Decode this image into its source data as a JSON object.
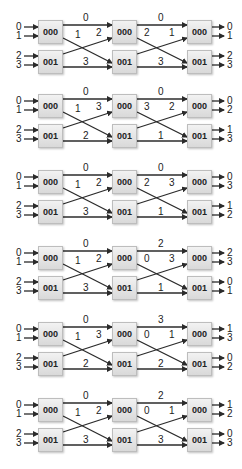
{
  "diagrams": [
    {
      "inputs": [
        "0",
        "1",
        "2",
        "3"
      ],
      "boxes": [
        "000",
        "001",
        "000",
        "001",
        "000",
        "001"
      ],
      "stage1": {
        "top": "0",
        "cross_down": "1",
        "cross_up": "2",
        "bottom": "3"
      },
      "stage2": {
        "top": "0",
        "cross_down": "2",
        "cross_up": "1",
        "bottom": "3"
      },
      "outputs": [
        "0",
        "1",
        "2",
        "3"
      ]
    },
    {
      "inputs": [
        "0",
        "1",
        "2",
        "3"
      ],
      "boxes": [
        "000",
        "001",
        "000",
        "001",
        "000",
        "001"
      ],
      "stage1": {
        "top": "0",
        "cross_down": "1",
        "cross_up": "3",
        "bottom": "2"
      },
      "stage2": {
        "top": "0",
        "cross_down": "3",
        "cross_up": "2",
        "bottom": "1"
      },
      "outputs": [
        "0",
        "2",
        "1",
        "3"
      ]
    },
    {
      "inputs": [
        "0",
        "1",
        "2",
        "3"
      ],
      "boxes": [
        "000",
        "001",
        "000",
        "001",
        "000",
        "001"
      ],
      "stage1": {
        "top": "0",
        "cross_down": "1",
        "cross_up": "2",
        "bottom": "3"
      },
      "stage2": {
        "top": "0",
        "cross_down": "2",
        "cross_up": "3",
        "bottom": "1"
      },
      "outputs": [
        "0",
        "3",
        "1",
        "2"
      ]
    },
    {
      "inputs": [
        "0",
        "1",
        "2",
        "3"
      ],
      "boxes": [
        "000",
        "001",
        "000",
        "001",
        "000",
        "001"
      ],
      "stage1": {
        "top": "0",
        "cross_down": "1",
        "cross_up": "2",
        "bottom": "3"
      },
      "stage2": {
        "top": "2",
        "cross_down": "0",
        "cross_up": "3",
        "bottom": "1"
      },
      "outputs": [
        "2",
        "3",
        "0",
        "1"
      ]
    },
    {
      "inputs": [
        "0",
        "1",
        "2",
        "3"
      ],
      "boxes": [
        "000",
        "001",
        "000",
        "001",
        "000",
        "001"
      ],
      "stage1": {
        "top": "0",
        "cross_down": "1",
        "cross_up": "3",
        "bottom": "2"
      },
      "stage2": {
        "top": "3",
        "cross_down": "0",
        "cross_up": "1",
        "bottom": "2"
      },
      "outputs": [
        "1",
        "3",
        "0",
        "2"
      ]
    },
    {
      "inputs": [
        "0",
        "1",
        "2",
        "3"
      ],
      "boxes": [
        "000",
        "001",
        "000",
        "001",
        "000",
        "001"
      ],
      "stage1": {
        "top": "0",
        "cross_down": "1",
        "cross_up": "2",
        "bottom": "3"
      },
      "stage2": {
        "top": "2",
        "cross_down": "0",
        "cross_up": "1",
        "bottom": "3"
      },
      "outputs": [
        "1",
        "2",
        "0",
        "3"
      ]
    }
  ],
  "colors": {
    "line": "#2b2b2b",
    "box_fill": "#e3e3e3",
    "text": "#222222"
  }
}
